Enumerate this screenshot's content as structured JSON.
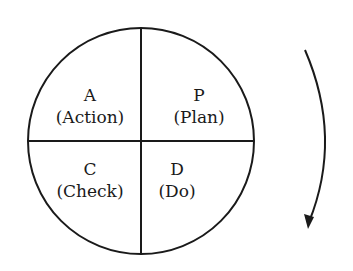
{
  "diagram": {
    "quadrants": [
      {
        "position": "top-left",
        "letter": "A",
        "name": "(Action)"
      },
      {
        "position": "top-right",
        "letter": "P",
        "name": "(Plan)"
      },
      {
        "position": "bottom-left",
        "letter": "C",
        "name": "(Check)"
      },
      {
        "position": "bottom-right",
        "letter": "D",
        "name": "(Do)"
      }
    ],
    "arrow": {
      "direction": "clockwise"
    },
    "colors": {
      "stroke": "#1a1a1a",
      "background": "#ffffff"
    }
  }
}
